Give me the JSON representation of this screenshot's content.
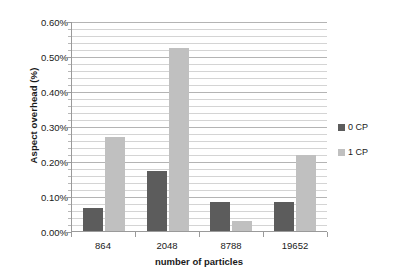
{
  "chart_data": {
    "type": "bar",
    "title": "",
    "xlabel": "number of particles",
    "ylabel": "Aspect overhead (%)",
    "categories": [
      "864",
      "2048",
      "8788",
      "19652"
    ],
    "series": [
      {
        "name": "0 CP",
        "color": "#5c5c5c",
        "values": [
          0.065,
          0.172,
          0.082,
          0.083
        ]
      },
      {
        "name": "1 CP",
        "color": "#c0c0c0",
        "values": [
          0.268,
          0.522,
          0.028,
          0.218
        ]
      }
    ],
    "ylim": [
      0,
      0.6
    ],
    "ytick_values": [
      0,
      0.1,
      0.2,
      0.3,
      0.4,
      0.5,
      0.6
    ],
    "ytick_labels": [
      "0.00%",
      "0.10%",
      "0.20%",
      "0.30%",
      "0.40%",
      "0.50%",
      "0.60%"
    ],
    "minor_tick_step": 0.02,
    "grid": true,
    "legend_position": "right",
    "legend": [
      "0 CP",
      "1 CP"
    ]
  }
}
